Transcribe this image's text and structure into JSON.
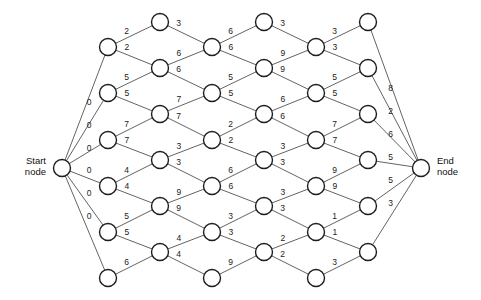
{
  "diagram": {
    "type": "shortest-path-network",
    "title": "",
    "start_label_line1": "Start",
    "start_label_line2": "node",
    "end_label_line1": "End",
    "end_label_line2": "node",
    "node_radius": 8.5,
    "colors": {
      "edge": "#3b3b3b",
      "node_stroke": "#1e1e1e",
      "node_fill": "#ffffff",
      "label": "#222222",
      "background": "#ffffff"
    },
    "terminals": {
      "start": {
        "id": "S",
        "x": 62,
        "y": 168
      },
      "end": {
        "id": "E",
        "x": 421,
        "y": 168
      }
    },
    "columns": [
      {
        "index": 1,
        "x": 108,
        "ys": [
          47,
          93,
          140,
          186,
          232,
          278
        ]
      },
      {
        "index": 2,
        "x": 160,
        "ys": [
          22,
          68,
          114,
          160,
          206,
          252
        ]
      },
      {
        "index": 3,
        "x": 212,
        "ys": [
          47,
          93,
          140,
          186,
          232,
          278
        ]
      },
      {
        "index": 4,
        "x": 264,
        "ys": [
          22,
          68,
          114,
          160,
          206,
          252
        ]
      },
      {
        "index": 5,
        "x": 316,
        "ys": [
          47,
          93,
          140,
          186,
          232,
          278
        ]
      },
      {
        "index": 6,
        "x": 368,
        "ys": [
          22,
          68,
          114,
          160,
          206,
          252
        ]
      }
    ],
    "edges": [
      {
        "from": "S",
        "to": "c1n1",
        "weight": "0"
      },
      {
        "from": "S",
        "to": "c1n2",
        "weight": "0"
      },
      {
        "from": "S",
        "to": "c1n3",
        "weight": "0"
      },
      {
        "from": "S",
        "to": "c1n4",
        "weight": "0"
      },
      {
        "from": "S",
        "to": "c1n5",
        "weight": "0"
      },
      {
        "from": "S",
        "to": "c1n6",
        "weight": "0"
      },
      {
        "from": "c1n1",
        "to": "c2n1",
        "weight": "2"
      },
      {
        "from": "c1n1",
        "to": "c2n2",
        "weight": "2"
      },
      {
        "from": "c1n2",
        "to": "c2n2",
        "weight": "5"
      },
      {
        "from": "c1n2",
        "to": "c2n3",
        "weight": "5"
      },
      {
        "from": "c1n3",
        "to": "c2n3",
        "weight": "7"
      },
      {
        "from": "c1n3",
        "to": "c2n4",
        "weight": "7"
      },
      {
        "from": "c1n4",
        "to": "c2n4",
        "weight": "4"
      },
      {
        "from": "c1n4",
        "to": "c2n5",
        "weight": "4"
      },
      {
        "from": "c1n5",
        "to": "c2n5",
        "weight": "5"
      },
      {
        "from": "c1n5",
        "to": "c2n6",
        "weight": "5"
      },
      {
        "from": "c1n6",
        "to": "c2n6",
        "weight": "6"
      },
      {
        "from": "c2n1",
        "to": "c3n1",
        "weight": "3"
      },
      {
        "from": "c2n2",
        "to": "c3n1",
        "weight": "6"
      },
      {
        "from": "c2n2",
        "to": "c3n2",
        "weight": "6"
      },
      {
        "from": "c2n3",
        "to": "c3n2",
        "weight": "7"
      },
      {
        "from": "c2n3",
        "to": "c3n3",
        "weight": "7"
      },
      {
        "from": "c2n4",
        "to": "c3n3",
        "weight": "3"
      },
      {
        "from": "c2n4",
        "to": "c3n4",
        "weight": "3"
      },
      {
        "from": "c2n5",
        "to": "c3n4",
        "weight": "9"
      },
      {
        "from": "c2n5",
        "to": "c3n5",
        "weight": "9"
      },
      {
        "from": "c2n6",
        "to": "c3n5",
        "weight": "4"
      },
      {
        "from": "c2n6",
        "to": "c3n6",
        "weight": "4"
      },
      {
        "from": "c3n1",
        "to": "c4n1",
        "weight": "6"
      },
      {
        "from": "c3n1",
        "to": "c4n2",
        "weight": "6"
      },
      {
        "from": "c3n2",
        "to": "c4n2",
        "weight": "5"
      },
      {
        "from": "c3n2",
        "to": "c4n3",
        "weight": "5"
      },
      {
        "from": "c3n3",
        "to": "c4n3",
        "weight": "2"
      },
      {
        "from": "c3n3",
        "to": "c4n4",
        "weight": "2"
      },
      {
        "from": "c3n4",
        "to": "c4n4",
        "weight": "6"
      },
      {
        "from": "c3n4",
        "to": "c4n5",
        "weight": "6"
      },
      {
        "from": "c3n5",
        "to": "c4n5",
        "weight": "3"
      },
      {
        "from": "c3n5",
        "to": "c4n6",
        "weight": "3"
      },
      {
        "from": "c3n6",
        "to": "c4n6",
        "weight": "9"
      },
      {
        "from": "c4n1",
        "to": "c5n1",
        "weight": "3"
      },
      {
        "from": "c4n2",
        "to": "c5n1",
        "weight": "9"
      },
      {
        "from": "c4n2",
        "to": "c5n2",
        "weight": "9"
      },
      {
        "from": "c4n3",
        "to": "c5n2",
        "weight": "6"
      },
      {
        "from": "c4n3",
        "to": "c5n3",
        "weight": "6"
      },
      {
        "from": "c4n4",
        "to": "c5n3",
        "weight": "3"
      },
      {
        "from": "c4n4",
        "to": "c5n4",
        "weight": "3"
      },
      {
        "from": "c4n5",
        "to": "c5n4",
        "weight": "3"
      },
      {
        "from": "c4n5",
        "to": "c5n5",
        "weight": "3"
      },
      {
        "from": "c4n6",
        "to": "c5n5",
        "weight": "2"
      },
      {
        "from": "c4n6",
        "to": "c5n6",
        "weight": "2"
      },
      {
        "from": "c5n1",
        "to": "c6n1",
        "weight": "3"
      },
      {
        "from": "c5n1",
        "to": "c6n2",
        "weight": "3"
      },
      {
        "from": "c5n2",
        "to": "c6n2",
        "weight": "5"
      },
      {
        "from": "c5n2",
        "to": "c6n3",
        "weight": "5"
      },
      {
        "from": "c5n3",
        "to": "c6n3",
        "weight": "7"
      },
      {
        "from": "c5n3",
        "to": "c6n4",
        "weight": "7"
      },
      {
        "from": "c5n4",
        "to": "c6n4",
        "weight": "9"
      },
      {
        "from": "c5n4",
        "to": "c6n5",
        "weight": "9"
      },
      {
        "from": "c5n5",
        "to": "c6n5",
        "weight": "1"
      },
      {
        "from": "c5n5",
        "to": "c6n6",
        "weight": "1"
      },
      {
        "from": "c5n6",
        "to": "c6n6",
        "weight": "3"
      },
      {
        "from": "c6n1",
        "to": "E",
        "weight": "8"
      },
      {
        "from": "c6n2",
        "to": "E",
        "weight": "2"
      },
      {
        "from": "c6n3",
        "to": "E",
        "weight": "6"
      },
      {
        "from": "c6n4",
        "to": "E",
        "weight": "5"
      },
      {
        "from": "c6n5",
        "to": "E",
        "weight": "5"
      },
      {
        "from": "c6n6",
        "to": "E",
        "weight": "3"
      }
    ]
  }
}
